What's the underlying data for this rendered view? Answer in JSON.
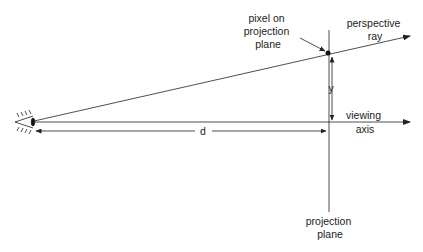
{
  "diagram": {
    "colors": {
      "line": "#222222",
      "background": "#ffffff"
    },
    "labels": {
      "pixel_on_plane": [
        "pixel on",
        "projection",
        "plane"
      ],
      "perspective_ray": [
        "perspective",
        "ray"
      ],
      "viewing_axis": [
        "viewing",
        "axis"
      ],
      "projection_plane": [
        "projection",
        "plane"
      ],
      "y": "y",
      "d": "d"
    },
    "icons": {
      "eye": "eye-icon"
    }
  }
}
